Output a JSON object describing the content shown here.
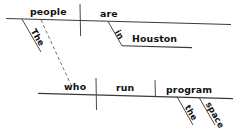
{
  "diagram": {
    "type": "reed-kellogg-sentence-diagram",
    "sentence": "The people who run the space program are in Houston.",
    "ink_color": "#111111",
    "line_color": "#3a3a3a",
    "dashed_line_color": "#6f6f6f",
    "background_color": "#ffffff",
    "clauses": [
      {
        "id": "main-clause",
        "subject": "people",
        "verb": "are",
        "subject_modifiers": [
          "The"
        ],
        "verb_modifiers": [
          {
            "preposition": "in",
            "object": "Houston"
          }
        ]
      },
      {
        "id": "relative-clause",
        "subject": "who",
        "verb": "run",
        "direct_object": "program",
        "object_modifiers": [
          "the",
          "space"
        ]
      }
    ],
    "connector": {
      "style": "dashed",
      "from": "people",
      "to": "who",
      "label": ""
    },
    "words": {
      "the_upper": "The",
      "people": "people",
      "are": "are",
      "in": "in",
      "houston": "Houston",
      "who": "who",
      "run": "run",
      "program": "program",
      "the_lower": "the",
      "space": "space"
    }
  }
}
